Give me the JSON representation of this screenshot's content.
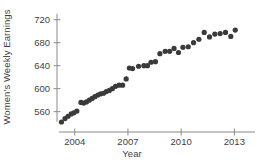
{
  "chart_data": {
    "type": "scatter",
    "title": "",
    "xlabel": "Year",
    "ylabel": "Women's Weekly Earnings",
    "xlim": [
      2003.0,
      2013.6
    ],
    "ylim": [
      535,
      730
    ],
    "xticks": [
      2004,
      2007,
      2010,
      2013
    ],
    "xtick_labels": [
      "2004",
      "2007",
      "2010",
      "2013"
    ],
    "yticks": [
      560,
      600,
      640,
      680,
      720
    ],
    "ytick_labels": [
      "560",
      "600",
      "640",
      "680",
      "720"
    ],
    "grid": false,
    "legend": null,
    "marker": {
      "shape": "circle",
      "color": "#3a3a3a",
      "size": 2.6
    },
    "axis_color": "#8a8a8a",
    "series": [
      {
        "name": "Women's Weekly Earnings",
        "x": [
          2003.25,
          2003.45,
          2003.62,
          2003.8,
          2003.95,
          2004.12,
          2004.35,
          2004.5,
          2004.66,
          2004.82,
          2004.98,
          2005.14,
          2005.3,
          2005.46,
          2005.62,
          2005.78,
          2005.95,
          2006.12,
          2006.3,
          2006.5,
          2006.7,
          2006.9,
          2007.08,
          2007.26,
          2007.6,
          2007.9,
          2008.1,
          2008.3,
          2008.55,
          2008.8,
          2009.1,
          2009.35,
          2009.6,
          2009.85,
          2010.1,
          2010.4,
          2010.7,
          2011.0,
          2011.3,
          2011.6,
          2011.9,
          2012.2,
          2012.5,
          2012.8,
          2013.05
        ],
        "y": [
          542,
          548,
          552,
          556,
          558,
          561,
          576,
          575,
          577,
          580,
          583,
          586,
          589,
          591,
          592,
          595,
          597,
          600,
          604,
          606,
          606,
          617,
          636,
          635,
          639,
          640,
          640,
          646,
          647,
          661,
          665,
          665,
          670,
          663,
          672,
          673,
          680,
          686,
          698,
          690,
          695,
          696,
          698,
          691,
          702
        ]
      }
    ]
  }
}
